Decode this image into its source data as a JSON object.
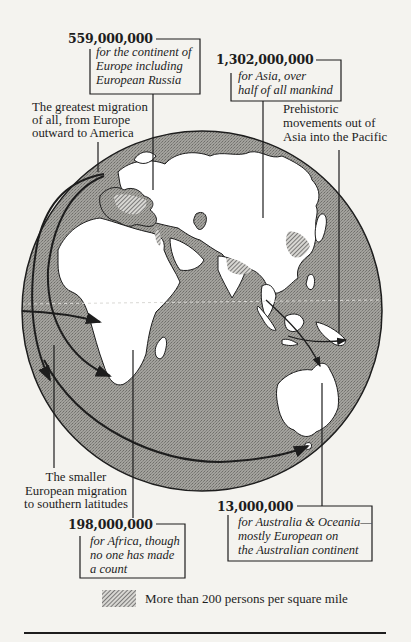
{
  "callouts": {
    "europe": {
      "number": "559,000,000",
      "lines": [
        "for the continent of",
        "Europe including",
        "European Russia"
      ]
    },
    "asia": {
      "number": "1,302,000,000",
      "lines": [
        "for Asia, over",
        "half of all mankind"
      ]
    },
    "africa": {
      "number": "198,000,000",
      "lines": [
        "for Africa, though",
        "no one has made",
        "a count"
      ]
    },
    "oceania": {
      "number": "13,000,000",
      "lines": [
        "for Australia & Oceania—",
        "mostly European on",
        "the Australian continent"
      ]
    }
  },
  "labels": {
    "greatest_migration": [
      "The greatest migration",
      "of all, from Europe",
      "outward to America"
    ],
    "prehistoric": [
      "Prehistoric",
      "movements out of",
      "Asia into the Pacific"
    ],
    "smaller_migration": [
      "The smaller",
      "European migration",
      "to southern latitudes"
    ]
  },
  "legend": {
    "swatch": "hatched-density-swatch",
    "text": "More than 200 persons per square mile"
  },
  "colors": {
    "ocean": "#9a9994",
    "land": "#ffffff",
    "ink": "#1d1d1d",
    "paper": "#f4f3ef"
  }
}
